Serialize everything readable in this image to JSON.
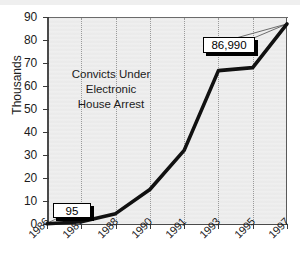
{
  "chart_data": {
    "type": "line",
    "title": "Convicts Under\nElectronic\nHouse Arrest",
    "title_lines": [
      "Convicts Under",
      "Electronic",
      "House Arrest"
    ],
    "xlabel": "",
    "ylabel": "Thousands",
    "categories": [
      "1986",
      "1987",
      "1988",
      "1990",
      "1991",
      "1993",
      "1995",
      "1997"
    ],
    "values": [
      0.095,
      1.0,
      4.5,
      15.0,
      32.0,
      66.7,
      68.0,
      86.99
    ],
    "ylim": [
      0,
      90
    ],
    "ytick_labels": [
      "0",
      "10",
      "20",
      "30",
      "40",
      "50",
      "60",
      "70",
      "80",
      "90"
    ],
    "ytick_values": [
      0,
      10,
      20,
      30,
      40,
      50,
      60,
      70,
      80,
      90
    ],
    "grid": "vertical-dotted",
    "legend": "none",
    "series_color": "#111111",
    "plot_bg_color": "#e9e9e9",
    "annotations": [
      {
        "label": "95",
        "category": "1986",
        "value": 0.095
      },
      {
        "label": "86,990",
        "category": "1997",
        "value": 86.99
      }
    ]
  },
  "colors": {
    "line": "#111111",
    "plot_background": "#e9e9e9",
    "page_background": "#ffffff",
    "gridline": "#9a9a9a",
    "axis": "#4a4a4a",
    "text": "#1b1b1b"
  }
}
